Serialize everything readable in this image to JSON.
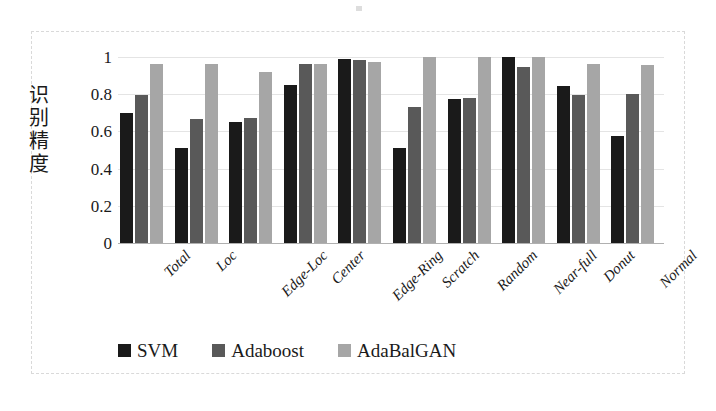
{
  "chart_data": {
    "type": "bar",
    "title": "",
    "xlabel": "",
    "ylabel": "识别精度",
    "ylim": [
      0,
      1
    ],
    "yticks": [
      "0",
      "0.2",
      "0.4",
      "0.6",
      "0.8",
      "1"
    ],
    "ytick_values": [
      0,
      0.2,
      0.4,
      0.6,
      0.8,
      1
    ],
    "grid": true,
    "legend_position": "bottom",
    "categories": [
      "Total",
      "Loc",
      "Edge-Loc",
      "Center",
      "Edge-Ring",
      "Scratch",
      "Random",
      "Near-full",
      "Donut",
      "Normal"
    ],
    "series": [
      {
        "name": "SVM",
        "color": "#1a1a1a",
        "values": [
          0.7,
          0.51,
          0.65,
          0.85,
          0.99,
          0.51,
          0.775,
          1.0,
          0.845,
          0.575
        ]
      },
      {
        "name": "Adaboost",
        "color": "#595959",
        "values": [
          0.795,
          0.665,
          0.67,
          0.96,
          0.985,
          0.73,
          0.78,
          0.945,
          0.795,
          0.8
        ]
      },
      {
        "name": "AdaBalGAN",
        "color": "#a6a6a6",
        "values": [
          0.96,
          0.96,
          0.92,
          0.96,
          0.975,
          1.0,
          1.0,
          1.0,
          0.965,
          0.955
        ]
      }
    ]
  },
  "legend": {
    "items": [
      {
        "label": "SVM",
        "color": "#1a1a1a"
      },
      {
        "label": "Adaboost",
        "color": "#595959"
      },
      {
        "label": "AdaBalGAN",
        "color": "#a6a6a6"
      }
    ]
  }
}
